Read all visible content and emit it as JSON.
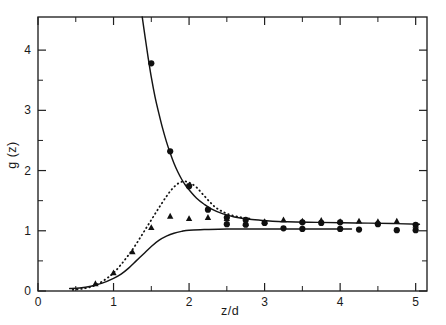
{
  "figure": {
    "background_color": "#ffffff",
    "ink_color": "#141414"
  },
  "axes": {
    "x_title": "z/d",
    "y_title": "g (z)",
    "x_tick_labels": [
      "0",
      "1",
      "2",
      "3",
      "4",
      "5"
    ],
    "y_tick_labels": [
      "0",
      "1",
      "2",
      "3",
      "4"
    ],
    "x_origin_label": "0",
    "y_origin_label": "0"
  },
  "chart_data": {
    "type": "scatter",
    "title": "",
    "xlabel": "z/d",
    "ylabel": "g (z)",
    "xlim": [
      0,
      5.15
    ],
    "ylim": [
      0,
      4.55
    ],
    "grid": false,
    "legend_position": "none",
    "x_ticks": [
      0,
      1,
      2,
      3,
      4,
      5
    ],
    "x_minor_ticks": [
      0.5,
      1.5,
      2.5,
      3.5,
      4.5
    ],
    "y_ticks": [
      0,
      1,
      2,
      3,
      4
    ],
    "y_minor_ticks": [
      0.5,
      1.5,
      2.5,
      3.5
    ],
    "series": [
      {
        "name": "circles",
        "marker": "circle",
        "type": "scatter",
        "points": [
          [
            1.5,
            3.78
          ],
          [
            1.75,
            2.32
          ],
          [
            2.0,
            1.74
          ],
          [
            2.25,
            1.35
          ],
          [
            2.5,
            1.22
          ],
          [
            2.5,
            1.11
          ],
          [
            2.75,
            1.18
          ],
          [
            2.75,
            1.1
          ],
          [
            3.0,
            1.13
          ],
          [
            3.25,
            1.04
          ],
          [
            3.5,
            1.14
          ],
          [
            3.5,
            1.03
          ],
          [
            3.75,
            1.13
          ],
          [
            4.0,
            1.14
          ],
          [
            4.0,
            1.03
          ],
          [
            4.25,
            1.02
          ],
          [
            4.5,
            1.11
          ],
          [
            4.75,
            1.01
          ],
          [
            5.0,
            1.1
          ],
          [
            5.0,
            1.01
          ]
        ]
      },
      {
        "name": "triangles",
        "marker": "triangle",
        "type": "scatter",
        "points": [
          [
            0.76,
            0.12
          ],
          [
            1.0,
            0.3
          ],
          [
            1.25,
            0.65
          ],
          [
            1.5,
            1.05
          ],
          [
            1.75,
            1.24
          ],
          [
            2.0,
            1.2
          ],
          [
            2.25,
            1.22
          ],
          [
            2.5,
            1.2
          ],
          [
            2.75,
            1.12
          ],
          [
            3.0,
            1.15
          ],
          [
            3.25,
            1.18
          ],
          [
            3.5,
            1.16
          ],
          [
            3.75,
            1.17
          ],
          [
            4.0,
            1.15
          ],
          [
            4.25,
            1.16
          ],
          [
            4.5,
            1.15
          ],
          [
            4.75,
            1.16
          ],
          [
            5.0,
            1.09
          ]
        ]
      },
      {
        "name": "upper-solid-curve",
        "type": "line",
        "style": "solid",
        "points": [
          [
            1.38,
            4.55
          ],
          [
            1.42,
            4.2
          ],
          [
            1.46,
            3.86
          ],
          [
            1.5,
            3.55
          ],
          [
            1.55,
            3.22
          ],
          [
            1.6,
            2.95
          ],
          [
            1.65,
            2.7
          ],
          [
            1.7,
            2.48
          ],
          [
            1.75,
            2.29
          ],
          [
            1.8,
            2.12
          ],
          [
            1.85,
            1.98
          ],
          [
            1.9,
            1.86
          ],
          [
            1.95,
            1.76
          ],
          [
            2.0,
            1.68
          ],
          [
            2.1,
            1.54
          ],
          [
            2.2,
            1.44
          ],
          [
            2.3,
            1.36
          ],
          [
            2.45,
            1.28
          ],
          [
            2.6,
            1.23
          ],
          [
            2.8,
            1.19
          ],
          [
            3.0,
            1.17
          ],
          [
            3.3,
            1.15
          ],
          [
            3.7,
            1.14
          ],
          [
            4.2,
            1.13
          ],
          [
            4.7,
            1.12
          ],
          [
            5.05,
            1.11
          ]
        ]
      },
      {
        "name": "lower-solid-curve",
        "type": "line",
        "style": "solid",
        "points": [
          [
            0.42,
            0.04
          ],
          [
            0.55,
            0.05
          ],
          [
            0.7,
            0.08
          ],
          [
            0.85,
            0.13
          ],
          [
            1.0,
            0.21
          ],
          [
            1.1,
            0.28
          ],
          [
            1.2,
            0.38
          ],
          [
            1.3,
            0.5
          ],
          [
            1.4,
            0.62
          ],
          [
            1.5,
            0.74
          ],
          [
            1.6,
            0.84
          ],
          [
            1.7,
            0.91
          ],
          [
            1.8,
            0.96
          ],
          [
            1.9,
            0.99
          ],
          [
            2.0,
            1.01
          ],
          [
            2.2,
            1.02
          ],
          [
            2.5,
            1.03
          ],
          [
            3.0,
            1.03
          ],
          [
            3.5,
            1.03
          ],
          [
            4.0,
            1.03
          ],
          [
            4.15,
            1.03
          ]
        ]
      },
      {
        "name": "dotted-curve",
        "type": "line",
        "style": "dotted",
        "points": [
          [
            0.46,
            0.02
          ],
          [
            0.6,
            0.04
          ],
          [
            0.75,
            0.09
          ],
          [
            0.9,
            0.2
          ],
          [
            1.0,
            0.3
          ],
          [
            1.1,
            0.44
          ],
          [
            1.2,
            0.6
          ],
          [
            1.3,
            0.78
          ],
          [
            1.4,
            0.98
          ],
          [
            1.5,
            1.18
          ],
          [
            1.6,
            1.38
          ],
          [
            1.7,
            1.57
          ],
          [
            1.78,
            1.7
          ],
          [
            1.86,
            1.79
          ],
          [
            1.94,
            1.82
          ],
          [
            2.02,
            1.79
          ],
          [
            2.1,
            1.72
          ],
          [
            2.18,
            1.61
          ],
          [
            2.26,
            1.5
          ],
          [
            2.34,
            1.4
          ],
          [
            2.44,
            1.32
          ],
          [
            2.56,
            1.26
          ],
          [
            2.7,
            1.22
          ],
          [
            2.82,
            1.2
          ]
        ]
      }
    ]
  }
}
